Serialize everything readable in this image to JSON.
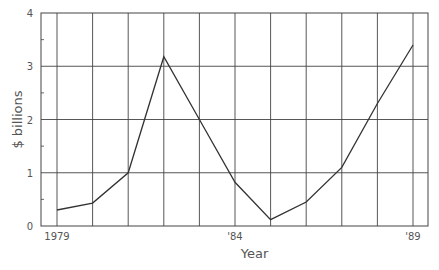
{
  "chart_data": {
    "type": "line",
    "title": "",
    "xlabel": "Year",
    "ylabel": "$ billions",
    "x": [
      1979,
      1980,
      1981,
      1982,
      1983,
      1984,
      1985,
      1986,
      1987,
      1988,
      1989
    ],
    "x_tick_labels": [
      "1979",
      "",
      "",
      "",
      "",
      "'84",
      "",
      "",
      "",
      "",
      "'89"
    ],
    "series": [
      {
        "name": "$ billions",
        "values": [
          0.3,
          0.43,
          1.0,
          3.18,
          2.0,
          0.82,
          0.12,
          0.45,
          1.1,
          2.3,
          3.4
        ]
      }
    ],
    "ylim": [
      0,
      4
    ],
    "y_ticks": [
      0,
      1,
      2,
      3,
      4
    ],
    "grid": true,
    "legend": "none"
  },
  "colors": {
    "line": "#333333",
    "grid": "#444444",
    "text": "#555555"
  }
}
